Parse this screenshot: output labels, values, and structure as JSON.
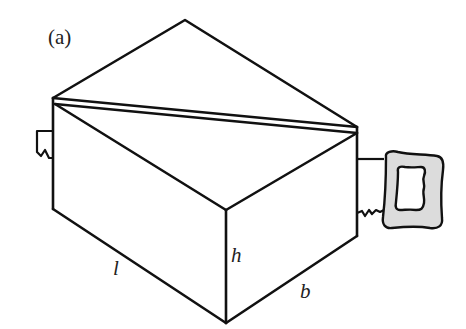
{
  "figure": {
    "panel_label": "(a)",
    "dimension_labels": {
      "length": "l",
      "height": "h",
      "breadth": "b"
    },
    "colors": {
      "line": "#111111",
      "saw_handle_fill": "#dcdcdc",
      "background": "#ffffff"
    }
  }
}
